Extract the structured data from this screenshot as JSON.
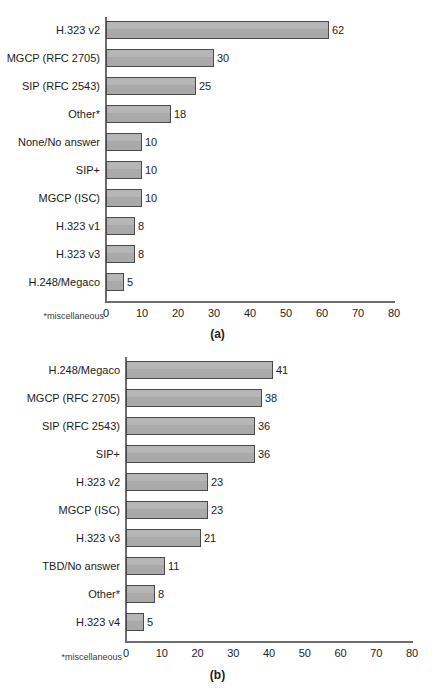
{
  "page": {
    "background": "#ffffff",
    "bar_fill": "#a9a9a9",
    "bar_border": "#4a4a4a",
    "axis_color": "#6d6d6d",
    "text_color": "#1c1c1c"
  },
  "chart_data": [
    {
      "id": "a",
      "type": "bar",
      "orientation": "horizontal",
      "title": "",
      "caption": "(a)",
      "xlabel": "",
      "ylabel": "",
      "xlim": [
        0,
        80
      ],
      "xticks": [
        0,
        10,
        20,
        30,
        40,
        50,
        60,
        70,
        80
      ],
      "xtick_labels": [
        "0",
        "10",
        "20",
        "30",
        "40",
        "50",
        "60",
        "70",
        "80"
      ],
      "grid": false,
      "legend": false,
      "footnote": "*miscellaneous",
      "categories": [
        "H.323 v2",
        "MGCP (RFC 2705)",
        "SIP (RFC 2543)",
        "Other*",
        "None/No answer",
        "SIP+",
        "MGCP (ISC)",
        "H.323 v1",
        "H.323 v3",
        "H.248/Megaco"
      ],
      "values": [
        62,
        30,
        25,
        18,
        10,
        10,
        10,
        8,
        8,
        5
      ],
      "value_labels": [
        "62",
        "30",
        "25",
        "18",
        "10",
        "10",
        "10",
        "8",
        "8",
        "5"
      ]
    },
    {
      "id": "b",
      "type": "bar",
      "orientation": "horizontal",
      "title": "",
      "caption": "(b)",
      "xlabel": "",
      "ylabel": "",
      "xlim": [
        0,
        80
      ],
      "xticks": [
        0,
        10,
        20,
        30,
        40,
        50,
        60,
        70,
        80
      ],
      "xtick_labels": [
        "0",
        "10",
        "20",
        "30",
        "40",
        "50",
        "60",
        "70",
        "80"
      ],
      "grid": false,
      "legend": false,
      "footnote": "*miscellaneous",
      "categories": [
        "H.248/Megaco",
        "MGCP (RFC 2705)",
        "SIP (RFC 2543)",
        "SIP+",
        "H.323 v2",
        "MGCP (ISC)",
        "H.323 v3",
        "TBD/No answer",
        "Other*",
        "H.323 v4"
      ],
      "values": [
        41,
        38,
        36,
        36,
        23,
        23,
        21,
        11,
        8,
        5
      ],
      "value_labels": [
        "41",
        "38",
        "36",
        "36",
        "23",
        "23",
        "21",
        "11",
        "8",
        "5"
      ]
    }
  ]
}
